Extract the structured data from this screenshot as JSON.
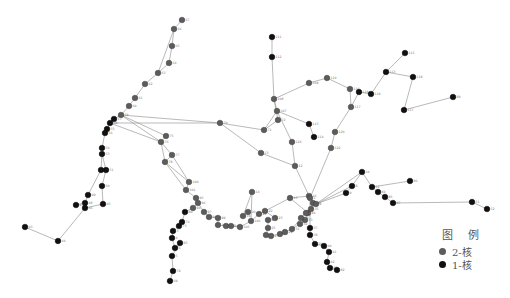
{
  "legend": {
    "title": "图 例",
    "items": [
      {
        "label": "2-核",
        "color": "#5c5c5c",
        "class": "node2"
      },
      {
        "label": "1-核",
        "color": "#111111",
        "class": "node1"
      }
    ]
  },
  "nodes": [
    {
      "id": "67",
      "x": 182,
      "y": 20,
      "k": 2
    },
    {
      "id": "66",
      "x": 174,
      "y": 29,
      "k": 2
    },
    {
      "id": "65",
      "x": 172,
      "y": 46,
      "k": 2
    },
    {
      "id": "64",
      "x": 169,
      "y": 63,
      "k": 2
    },
    {
      "id": "63",
      "x": 158,
      "y": 73,
      "k": 2
    },
    {
      "id": "62",
      "x": 145,
      "y": 84,
      "k": 2
    },
    {
      "id": "61",
      "x": 135,
      "y": 98,
      "k": 2
    },
    {
      "id": "60",
      "x": 129,
      "y": 106,
      "k": 2
    },
    {
      "id": "59",
      "x": 121,
      "y": 115,
      "k": 2
    },
    {
      "id": "57",
      "x": 114,
      "y": 119,
      "k": 1
    },
    {
      "id": "58",
      "x": 110,
      "y": 123,
      "k": 1
    },
    {
      "id": "55",
      "x": 107,
      "y": 129,
      "k": 1
    },
    {
      "id": "56",
      "x": 105,
      "y": 133,
      "k": 1
    },
    {
      "id": "54",
      "x": 102,
      "y": 148,
      "k": 1
    },
    {
      "id": "53",
      "x": 102,
      "y": 154,
      "k": 1
    },
    {
      "id": "52",
      "x": 101,
      "y": 170,
      "k": 1
    },
    {
      "id": "51",
      "x": 106,
      "y": 170,
      "k": 1
    },
    {
      "id": "50",
      "x": 102,
      "y": 186,
      "k": 1
    },
    {
      "id": "49",
      "x": 88,
      "y": 195,
      "k": 1
    },
    {
      "id": "48",
      "x": 85,
      "y": 203,
      "k": 1
    },
    {
      "id": "47",
      "x": 76,
      "y": 205,
      "k": 1
    },
    {
      "id": "46",
      "x": 85,
      "y": 208,
      "k": 1
    },
    {
      "id": "45",
      "x": 103,
      "y": 204,
      "k": 1
    },
    {
      "id": "44",
      "x": 58,
      "y": 241,
      "k": 1
    },
    {
      "id": "43",
      "x": 25,
      "y": 227,
      "k": 1
    },
    {
      "id": "70",
      "x": 220,
      "y": 123,
      "k": 2
    },
    {
      "id": "75",
      "x": 166,
      "y": 136,
      "k": 2
    },
    {
      "id": "76",
      "x": 161,
      "y": 142,
      "k": 2
    },
    {
      "id": "77",
      "x": 172,
      "y": 155,
      "k": 2
    },
    {
      "id": "78",
      "x": 165,
      "y": 162,
      "k": 2
    },
    {
      "id": "100",
      "x": 189,
      "y": 182,
      "k": 2
    },
    {
      "id": "101",
      "x": 186,
      "y": 190,
      "k": 2
    },
    {
      "id": "95",
      "x": 196,
      "y": 198,
      "k": 2
    },
    {
      "id": "96",
      "x": 198,
      "y": 203,
      "k": 2
    },
    {
      "id": "94",
      "x": 193,
      "y": 208,
      "k": 2
    },
    {
      "id": "97",
      "x": 204,
      "y": 212,
      "k": 2
    },
    {
      "id": "98",
      "x": 209,
      "y": 217,
      "k": 2
    },
    {
      "id": "99",
      "x": 218,
      "y": 218,
      "k": 2
    },
    {
      "id": "102",
      "x": 218,
      "y": 225,
      "k": 2
    },
    {
      "id": "103",
      "x": 226,
      "y": 226,
      "k": 2
    },
    {
      "id": "104",
      "x": 231,
      "y": 226,
      "k": 2
    },
    {
      "id": "105",
      "x": 240,
      "y": 227,
      "k": 2
    },
    {
      "id": "106",
      "x": 251,
      "y": 221,
      "k": 2
    },
    {
      "id": "14",
      "x": 252,
      "y": 192,
      "k": 2
    },
    {
      "id": "19",
      "x": 243,
      "y": 216,
      "k": 2
    },
    {
      "id": "20",
      "x": 248,
      "y": 212,
      "k": 2
    },
    {
      "id": "21",
      "x": 259,
      "y": 214,
      "k": 2
    },
    {
      "id": "22",
      "x": 265,
      "y": 211,
      "k": 2
    },
    {
      "id": "23",
      "x": 275,
      "y": 218,
      "k": 2
    },
    {
      "id": "24",
      "x": 268,
      "y": 220,
      "k": 2
    },
    {
      "id": "25",
      "x": 268,
      "y": 228,
      "k": 2
    },
    {
      "id": "26",
      "x": 266,
      "y": 235,
      "k": 2
    },
    {
      "id": "27",
      "x": 271,
      "y": 236,
      "k": 2
    },
    {
      "id": "28",
      "x": 280,
      "y": 234,
      "k": 2
    },
    {
      "id": "29",
      "x": 285,
      "y": 232,
      "k": 2
    },
    {
      "id": "31",
      "x": 292,
      "y": 229,
      "k": 2
    },
    {
      "id": "32",
      "x": 300,
      "y": 224,
      "k": 2
    },
    {
      "id": "33",
      "x": 305,
      "y": 220,
      "k": 2
    },
    {
      "id": "34",
      "x": 308,
      "y": 213,
      "k": 2
    },
    {
      "id": "35",
      "x": 311,
      "y": 209,
      "k": 2
    },
    {
      "id": "36",
      "x": 313,
      "y": 203,
      "k": 2
    },
    {
      "id": "15",
      "x": 290,
      "y": 198,
      "k": 2
    },
    {
      "id": "16",
      "x": 309,
      "y": 196,
      "k": 2
    },
    {
      "id": "17",
      "x": 306,
      "y": 213,
      "k": 2
    },
    {
      "id": "18",
      "x": 301,
      "y": 218,
      "k": 2
    },
    {
      "id": "37",
      "x": 310,
      "y": 228,
      "k": 1
    },
    {
      "id": "38",
      "x": 310,
      "y": 235,
      "k": 1
    },
    {
      "id": "39",
      "x": 315,
      "y": 244,
      "k": 1
    },
    {
      "id": "40",
      "x": 324,
      "y": 246,
      "k": 1
    },
    {
      "id": "41",
      "x": 329,
      "y": 252,
      "k": 1
    },
    {
      "id": "42",
      "x": 327,
      "y": 262,
      "k": 1
    },
    {
      "id": "81",
      "x": 330,
      "y": 268,
      "k": 1
    },
    {
      "id": "82",
      "x": 337,
      "y": 270,
      "k": 1
    },
    {
      "id": "12",
      "x": 295,
      "y": 166,
      "k": 2
    },
    {
      "id": "13",
      "x": 261,
      "y": 153,
      "k": 2
    },
    {
      "id": "1",
      "x": 310,
      "y": 198,
      "k": 2
    },
    {
      "id": "2",
      "x": 316,
      "y": 204,
      "k": 2
    },
    {
      "id": "71",
      "x": 264,
      "y": 130,
      "k": 2
    },
    {
      "id": "72",
      "x": 278,
      "y": 120,
      "k": 2
    },
    {
      "id": "107",
      "x": 277,
      "y": 111,
      "k": 2
    },
    {
      "id": "108",
      "x": 274,
      "y": 99,
      "k": 2
    },
    {
      "id": "111",
      "x": 272,
      "y": 37,
      "k": 1
    },
    {
      "id": "112",
      "x": 272,
      "y": 57,
      "k": 1
    },
    {
      "id": "109",
      "x": 309,
      "y": 83,
      "k": 2
    },
    {
      "id": "110",
      "x": 327,
      "y": 78,
      "k": 2
    },
    {
      "id": "113",
      "x": 309,
      "y": 124,
      "k": 1
    },
    {
      "id": "114",
      "x": 314,
      "y": 137,
      "k": 1
    },
    {
      "id": "124",
      "x": 292,
      "y": 142,
      "k": 2
    },
    {
      "id": "116",
      "x": 350,
      "y": 89,
      "k": 2
    },
    {
      "id": "117",
      "x": 351,
      "y": 107,
      "k": 2
    },
    {
      "id": "118",
      "x": 359,
      "y": 92,
      "k": 1
    },
    {
      "id": "119",
      "x": 371,
      "y": 94,
      "k": 1
    },
    {
      "id": "120",
      "x": 335,
      "y": 132,
      "k": 2
    },
    {
      "id": "122",
      "x": 331,
      "y": 148,
      "k": 2
    },
    {
      "id": "115",
      "x": 405,
      "y": 53,
      "k": 1
    },
    {
      "id": "113b",
      "x": 386,
      "y": 72,
      "k": 1
    },
    {
      "id": "118b",
      "x": 413,
      "y": 77,
      "k": 1
    },
    {
      "id": "117b",
      "x": 404,
      "y": 110,
      "k": 1
    },
    {
      "id": "89",
      "x": 453,
      "y": 97,
      "k": 1
    },
    {
      "id": "9",
      "x": 346,
      "y": 193,
      "k": 1
    },
    {
      "id": "8",
      "x": 352,
      "y": 186,
      "k": 1
    },
    {
      "id": "10",
      "x": 362,
      "y": 172,
      "k": 1
    },
    {
      "id": "11",
      "x": 372,
      "y": 187,
      "k": 1
    },
    {
      "id": "84",
      "x": 378,
      "y": 192,
      "k": 1
    },
    {
      "id": "85",
      "x": 385,
      "y": 197,
      "k": 1
    },
    {
      "id": "86",
      "x": 410,
      "y": 181,
      "k": 1
    },
    {
      "id": "87",
      "x": 393,
      "y": 203,
      "k": 1
    },
    {
      "id": "51b",
      "x": 472,
      "y": 202,
      "k": 1
    },
    {
      "id": "52b",
      "x": 487,
      "y": 209,
      "k": 1
    },
    {
      "id": "83",
      "x": 180,
      "y": 243,
      "k": 1
    },
    {
      "id": "5",
      "x": 172,
      "y": 256,
      "k": 1
    },
    {
      "id": "6",
      "x": 175,
      "y": 248,
      "k": 1
    },
    {
      "id": "4",
      "x": 172,
      "y": 238,
      "k": 1
    },
    {
      "id": "3",
      "x": 173,
      "y": 231,
      "k": 1
    },
    {
      "id": "73",
      "x": 179,
      "y": 226,
      "k": 1
    },
    {
      "id": "74",
      "x": 182,
      "y": 222,
      "k": 1
    },
    {
      "id": "80",
      "x": 185,
      "y": 212,
      "k": 1
    },
    {
      "id": "79",
      "x": 173,
      "y": 271,
      "k": 1
    },
    {
      "id": "69",
      "x": 170,
      "y": 281,
      "k": 1
    }
  ],
  "edges": [
    [
      "67",
      "66"
    ],
    [
      "66",
      "65"
    ],
    [
      "65",
      "64"
    ],
    [
      "64",
      "63"
    ],
    [
      "63",
      "62"
    ],
    [
      "62",
      "61"
    ],
    [
      "61",
      "60"
    ],
    [
      "60",
      "59"
    ],
    [
      "66",
      "63"
    ],
    [
      "59",
      "57"
    ],
    [
      "57",
      "58"
    ],
    [
      "58",
      "55"
    ],
    [
      "55",
      "56"
    ],
    [
      "56",
      "54"
    ],
    [
      "54",
      "53"
    ],
    [
      "53",
      "52"
    ],
    [
      "52",
      "51"
    ],
    [
      "53",
      "51"
    ],
    [
      "51",
      "50"
    ],
    [
      "52",
      "49"
    ],
    [
      "50",
      "45"
    ],
    [
      "49",
      "48"
    ],
    [
      "48",
      "47"
    ],
    [
      "48",
      "46"
    ],
    [
      "46",
      "45"
    ],
    [
      "46",
      "44"
    ],
    [
      "44",
      "43"
    ],
    [
      "59",
      "70"
    ],
    [
      "58",
      "70"
    ],
    [
      "59",
      "75"
    ],
    [
      "58",
      "76"
    ],
    [
      "59",
      "76"
    ],
    [
      "75",
      "76"
    ],
    [
      "76",
      "77"
    ],
    [
      "76",
      "78"
    ],
    [
      "77",
      "100"
    ],
    [
      "78",
      "101"
    ],
    [
      "100",
      "101"
    ],
    [
      "101",
      "95"
    ],
    [
      "95",
      "96"
    ],
    [
      "96",
      "94"
    ],
    [
      "96",
      "97"
    ],
    [
      "97",
      "98"
    ],
    [
      "98",
      "99"
    ],
    [
      "99",
      "102"
    ],
    [
      "102",
      "103"
    ],
    [
      "103",
      "104"
    ],
    [
      "104",
      "105"
    ],
    [
      "105",
      "106"
    ],
    [
      "106",
      "14"
    ],
    [
      "14",
      "19"
    ],
    [
      "19",
      "20"
    ],
    [
      "106",
      "21"
    ],
    [
      "21",
      "22"
    ],
    [
      "22",
      "23"
    ],
    [
      "23",
      "24"
    ],
    [
      "24",
      "25"
    ],
    [
      "25",
      "26"
    ],
    [
      "26",
      "27"
    ],
    [
      "27",
      "28"
    ],
    [
      "28",
      "29"
    ],
    [
      "29",
      "31"
    ],
    [
      "31",
      "32"
    ],
    [
      "32",
      "33"
    ],
    [
      "33",
      "34"
    ],
    [
      "34",
      "35"
    ],
    [
      "35",
      "36"
    ],
    [
      "22",
      "15"
    ],
    [
      "15",
      "16"
    ],
    [
      "15",
      "34"
    ],
    [
      "16",
      "1"
    ],
    [
      "1",
      "2"
    ],
    [
      "2",
      "17"
    ],
    [
      "17",
      "18"
    ],
    [
      "18",
      "31"
    ],
    [
      "1",
      "37"
    ],
    [
      "37",
      "38"
    ],
    [
      "38",
      "39"
    ],
    [
      "39",
      "40"
    ],
    [
      "40",
      "41"
    ],
    [
      "41",
      "42"
    ],
    [
      "42",
      "81"
    ],
    [
      "81",
      "82"
    ],
    [
      "70",
      "71"
    ],
    [
      "70",
      "13"
    ],
    [
      "13",
      "12"
    ],
    [
      "12",
      "1"
    ],
    [
      "12",
      "124"
    ],
    [
      "124",
      "107"
    ],
    [
      "107",
      "71"
    ],
    [
      "71",
      "72"
    ],
    [
      "72",
      "108"
    ],
    [
      "108",
      "107"
    ],
    [
      "108",
      "112"
    ],
    [
      "112",
      "111"
    ],
    [
      "108",
      "109"
    ],
    [
      "109",
      "110"
    ],
    [
      "110",
      "116"
    ],
    [
      "116",
      "117"
    ],
    [
      "117",
      "118"
    ],
    [
      "118",
      "119"
    ],
    [
      "117",
      "120"
    ],
    [
      "120",
      "122"
    ],
    [
      "122",
      "1"
    ],
    [
      "107",
      "113"
    ],
    [
      "113",
      "114"
    ],
    [
      "119",
      "113b"
    ],
    [
      "113b",
      "115"
    ],
    [
      "113b",
      "118b"
    ],
    [
      "118b",
      "117b"
    ],
    [
      "117b",
      "89"
    ],
    [
      "2",
      "9"
    ],
    [
      "2",
      "8"
    ],
    [
      "2",
      "10"
    ],
    [
      "9",
      "8"
    ],
    [
      "8",
      "10"
    ],
    [
      "10",
      "11"
    ],
    [
      "11",
      "84"
    ],
    [
      "84",
      "85"
    ],
    [
      "85",
      "87"
    ],
    [
      "11",
      "86"
    ],
    [
      "87",
      "51b"
    ],
    [
      "51b",
      "52b"
    ],
    [
      "94",
      "80"
    ],
    [
      "80",
      "74"
    ],
    [
      "74",
      "73"
    ],
    [
      "73",
      "3"
    ],
    [
      "3",
      "4"
    ],
    [
      "4",
      "6"
    ],
    [
      "6",
      "83"
    ],
    [
      "83",
      "5"
    ],
    [
      "5",
      "79"
    ],
    [
      "79",
      "69"
    ],
    [
      "100",
      "78"
    ],
    [
      "77",
      "78"
    ]
  ]
}
